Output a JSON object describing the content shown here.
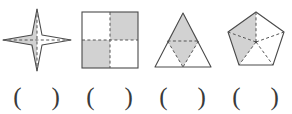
{
  "worksheet": {
    "type": "symmetry-identification-exercise",
    "shade_color": "#d2d2d2",
    "outline_color": "#4a4a4a",
    "dash_color": "#555555",
    "paren_open": "(",
    "paren_close": ")",
    "figures": [
      {
        "id": "four-pointed-star",
        "name": "four-pointed star",
        "shaded_region": "left half",
        "answer": ""
      },
      {
        "id": "checkerboard-square",
        "name": "square divided into four quadrants",
        "shaded_region": "top-right and bottom-left quadrants",
        "answer": ""
      },
      {
        "id": "triangle-rhombus",
        "name": "equilateral triangle with midpoint subdivision",
        "shaded_region": "central rhombus",
        "answer": ""
      },
      {
        "id": "pentagon-sectors",
        "name": "regular pentagon divided into five central triangles",
        "shaded_region": "two adjacent triangles",
        "answer": ""
      }
    ]
  }
}
